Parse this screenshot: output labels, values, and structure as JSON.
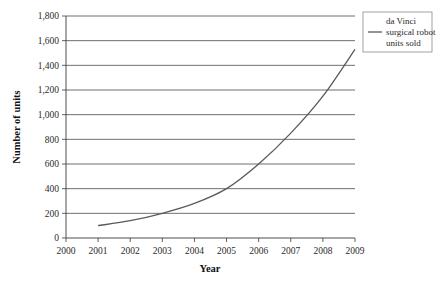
{
  "chart_data": {
    "type": "line",
    "title": "",
    "xlabel": "Year",
    "ylabel": "Number of units",
    "x": [
      2001,
      2002,
      2003,
      2004,
      2005,
      2006,
      2007,
      2008,
      2009
    ],
    "series": [
      {
        "name": "da Vinci surgical robot units sold",
        "values": [
          100,
          140,
          200,
          280,
          400,
          600,
          850,
          1150,
          1530
        ]
      }
    ],
    "xlim": [
      2000,
      2009
    ],
    "ylim": [
      0,
      1800
    ],
    "xticks": [
      "2000",
      "2001",
      "2002",
      "2003",
      "2004",
      "2005",
      "2006",
      "2007",
      "2008",
      "2009"
    ],
    "yticks": [
      "0",
      "200",
      "400",
      "600",
      "800",
      "1,000",
      "1,200",
      "1,400",
      "1,600",
      "1,800"
    ],
    "grid": "horizontal",
    "legend_position": "top-right",
    "legend_entries": [
      "da Vinci",
      "surgical robot",
      "units sold"
    ],
    "colors": {
      "series_line": "#5a5a5a",
      "gridline": "#4a4a4a",
      "axis": "#3a3a3a",
      "text": "#2b2b2b",
      "background": "#ffffff"
    }
  }
}
